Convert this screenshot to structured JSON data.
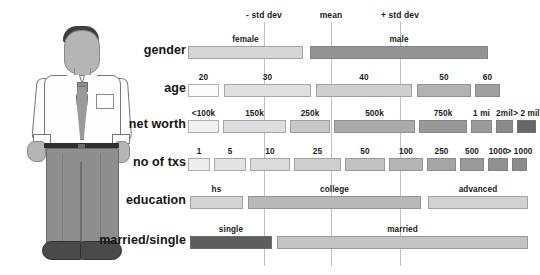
{
  "figure": {
    "illustration_name": "male-person-illustration"
  },
  "chart_data": {
    "type": "bar",
    "title": "",
    "xlabel": "",
    "ylabel": "",
    "orientation": "horizontal-stacked",
    "grid": false,
    "reference_lines": [
      {
        "label": "- std dev",
        "x_px": 264
      },
      {
        "label": "mean",
        "x_px": 331
      },
      {
        "label": "+ std dev",
        "x_px": 400
      }
    ],
    "axis_px": {
      "left": 188,
      "right": 488
    },
    "rows": [
      {
        "name": "gender",
        "label": "gender",
        "segments": [
          {
            "label": "female",
            "start_px": 188,
            "end_px": 303,
            "color": "#d6d6d6"
          },
          {
            "label": "male",
            "start_px": 310,
            "end_px": 488,
            "color": "#939393"
          }
        ]
      },
      {
        "name": "age",
        "label": "age",
        "segments": [
          {
            "label": "20",
            "start_px": 188,
            "end_px": 219,
            "color": "#fbfbfb"
          },
          {
            "label": "30",
            "start_px": 224,
            "end_px": 311,
            "color": "#e0e0e0"
          },
          {
            "label": "40",
            "start_px": 316,
            "end_px": 412,
            "color": "#cfcfcf"
          },
          {
            "label": "50",
            "start_px": 417,
            "end_px": 471,
            "color": "#b2b2b2"
          },
          {
            "label": "60",
            "start_px": 475,
            "end_px": 500,
            "color": "#a0a0a0"
          }
        ]
      },
      {
        "name": "net-worth",
        "label": "net worth",
        "segments": [
          {
            "label": "<100k",
            "start_px": 188,
            "end_px": 219,
            "color": "#f2f2f2"
          },
          {
            "label": "150k",
            "start_px": 223,
            "end_px": 286,
            "color": "#dedede"
          },
          {
            "label": "250k",
            "start_px": 290,
            "end_px": 330,
            "color": "#c8c8c8"
          },
          {
            "label": "500k",
            "start_px": 334,
            "end_px": 415,
            "color": "#ababab"
          },
          {
            "label": "750k",
            "start_px": 419,
            "end_px": 467,
            "color": "#989898"
          },
          {
            "label": "1 mi",
            "start_px": 471,
            "end_px": 492,
            "color": "#9b9b9b"
          },
          {
            "label": "2mil",
            "start_px": 496,
            "end_px": 513,
            "color": "#8a8a8a"
          },
          {
            "label": "> 2 mil",
            "start_px": 517,
            "end_px": 536,
            "color": "#676767"
          }
        ]
      },
      {
        "name": "no-of-txs",
        "label": "no of txs",
        "segments": [
          {
            "label": "1",
            "start_px": 188,
            "end_px": 210,
            "color": "#ededed"
          },
          {
            "label": "5",
            "start_px": 214,
            "end_px": 246,
            "color": "#e3e3e3"
          },
          {
            "label": "10",
            "start_px": 250,
            "end_px": 290,
            "color": "#dbdbdb"
          },
          {
            "label": "25",
            "start_px": 294,
            "end_px": 341,
            "color": "#cfcfcf"
          },
          {
            "label": "50",
            "start_px": 345,
            "end_px": 385,
            "color": "#c2c2c2"
          },
          {
            "label": "100",
            "start_px": 389,
            "end_px": 423,
            "color": "#b5b5b5"
          },
          {
            "label": "250",
            "start_px": 427,
            "end_px": 456,
            "color": "#a5a5a5"
          },
          {
            "label": "500",
            "start_px": 460,
            "end_px": 484,
            "color": "#9a9a9a"
          },
          {
            "label": "1000",
            "start_px": 488,
            "end_px": 508,
            "color": "#909090"
          },
          {
            "label": "> 1000",
            "start_px": 512,
            "end_px": 527,
            "color": "#8b8b8b"
          }
        ]
      },
      {
        "name": "education",
        "label": "education",
        "segments": [
          {
            "label": "hs",
            "start_px": 190,
            "end_px": 243,
            "color": "#d4d4d4"
          },
          {
            "label": "college",
            "start_px": 248,
            "end_px": 421,
            "color": "#b8b8b8"
          },
          {
            "label": "advanced",
            "start_px": 428,
            "end_px": 528,
            "color": "#d2d2d2"
          }
        ]
      },
      {
        "name": "married-single",
        "label": "married/single",
        "segments": [
          {
            "label": "single",
            "start_px": 190,
            "end_px": 272,
            "color": "#5d5d5d"
          },
          {
            "label": "married",
            "start_px": 277,
            "end_px": 528,
            "color": "#c3c3c3"
          }
        ]
      }
    ]
  },
  "layout": {
    "row_y_px": [
      46,
      84,
      120,
      158,
      196,
      236
    ],
    "label_right_px": 186,
    "line_top_px": 22,
    "line_bottom_px": 266
  }
}
